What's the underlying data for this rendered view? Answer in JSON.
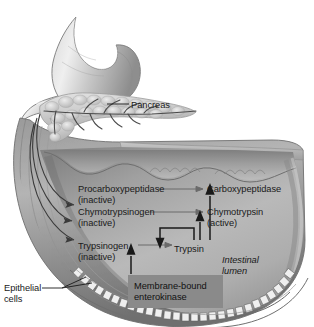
{
  "figure": {
    "background_color": "#ffffff",
    "ink_color": "#1a1a1a",
    "highlight_box_color": "#8a8a8a"
  },
  "anatomy": {
    "stomach": "stomach",
    "duodenum": "duodenum",
    "pancreas_organ": "pancreas",
    "pancreatic_duct": "pancreatic-duct",
    "intestinal_wall": "intestinal-wall",
    "epithelial_cell_layer": "epithelial-cell-layer"
  },
  "labels": {
    "pancreas": "Pancreas",
    "epithelial_cells": "Epithelial\ncells",
    "epithelial_cells_line1": "Epithelial",
    "epithelial_cells_line2": "cells",
    "intestinal_lumen_line1": "Intestinal",
    "intestinal_lumen_line2": "lumen",
    "enterokinase_line1": "Membrane-bound",
    "enterokinase_line2": "enterokinase"
  },
  "zymogens": [
    {
      "name": "Procarboxypeptidase",
      "state": "(inactive)"
    },
    {
      "name": "Chymotrypsinogen",
      "state": "(inactive)"
    },
    {
      "name": "Trypsinogen",
      "state": "(inactive)"
    }
  ],
  "active_enzymes": [
    {
      "name": "Carboxypeptidase",
      "state": ""
    },
    {
      "name": "Chymotrypsin",
      "state": "(active)"
    },
    {
      "name": "Trypsin",
      "state": ""
    }
  ],
  "reactions": [
    {
      "from": "Trypsinogen",
      "to": "Trypsin",
      "catalyst": "Membrane-bound enterokinase"
    },
    {
      "from": "Chymotrypsinogen",
      "to": "Chymotrypsin",
      "catalyst": "Trypsin"
    },
    {
      "from": "Procarboxypeptidase",
      "to": "Carboxypeptidase",
      "catalyst": "Trypsin"
    },
    {
      "from": "Trypsinogen",
      "to": "Trypsin",
      "catalyst": "Trypsin (autocatalysis)"
    }
  ],
  "icons": {
    "arrow_conversion": "arrow-right-icon",
    "arrow_catalysis": "arrow-up-icon",
    "arrow_autocatalysis": "arrow-down-icon",
    "leader_line": "leader-line-icon"
  }
}
